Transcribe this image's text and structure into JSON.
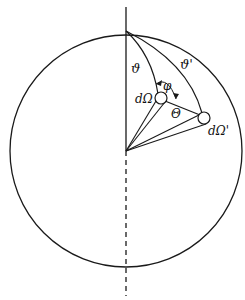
{
  "diagram": {
    "type": "spherical-geometry",
    "colors": {
      "stroke": "#1a1a1a",
      "background": "#ffffff"
    },
    "labels": {
      "theta": "ϑ",
      "theta_prime": "ϑ'",
      "phi": "φ",
      "big_theta": "Θ",
      "d_omega": "dΩ",
      "d_omega_prime": "dΩ'"
    },
    "elements": [
      {
        "name": "sphere-outline",
        "kind": "circle"
      },
      {
        "name": "polar-axis",
        "kind": "line",
        "upper": "solid",
        "lower": "dashed"
      },
      {
        "name": "meridian-theta",
        "kind": "arc"
      },
      {
        "name": "meridian-theta-prime",
        "kind": "arc"
      },
      {
        "name": "solid-angle-element",
        "label": "dΩ"
      },
      {
        "name": "solid-angle-element-prime",
        "label": "dΩ'"
      },
      {
        "name": "angle-phi-arrow",
        "label": "φ"
      },
      {
        "name": "scattering-angle-arc",
        "label": "Θ"
      }
    ]
  }
}
